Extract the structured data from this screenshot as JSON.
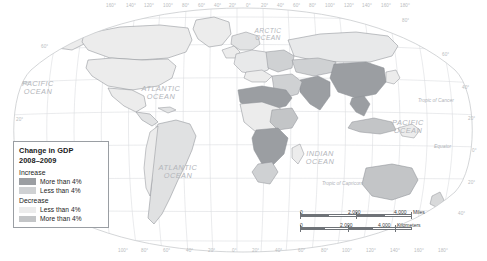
{
  "map": {
    "projection_note": "world map, Robinson-style graticule",
    "background_color": "#ffffff",
    "land_default_color": "#f0f0f0",
    "border_color": "#8e9196",
    "graticule_color": "#d9dbde",
    "ocean_color": "#ffffff"
  },
  "legend": {
    "title_line1": "Change in GDP",
    "title_line2": "2008–2009",
    "groups": [
      {
        "name": "increase",
        "heading": "Increase",
        "items": [
          {
            "label": "More than 4%",
            "color": "#9b9ea2"
          },
          {
            "label": "Less than 4%",
            "color": "#cfd1d3"
          }
        ]
      },
      {
        "name": "decrease",
        "heading": "Decrease",
        "items": [
          {
            "label": "Less than 4%",
            "color": "#ececec"
          },
          {
            "label": "More than 4%",
            "color": "#c3c5c7"
          }
        ]
      }
    ]
  },
  "scale": {
    "miles": {
      "zero": "0",
      "mid": "2,000",
      "max": "4,000",
      "unit": "Miles"
    },
    "kilometers": {
      "zero": "0",
      "mid": "2,000",
      "max": "4,000",
      "unit": "Kilometers"
    }
  },
  "labels": {
    "oceans": [
      {
        "name": "arctic-ocean",
        "line1": "ARCTIC",
        "line2": "OCEAN",
        "x": 268,
        "y": 27,
        "size": "mid"
      },
      {
        "name": "pacific-ocean-north",
        "line1": "PACIFIC",
        "line2": "OCEAN",
        "x": 38,
        "y": 80,
        "size": "big"
      },
      {
        "name": "atlantic-ocean-north",
        "line1": "ATLANTIC",
        "line2": "OCEAN",
        "x": 161,
        "y": 85,
        "size": "big"
      },
      {
        "name": "atlantic-ocean-south",
        "line1": "ATLANTIC",
        "line2": "OCEAN",
        "x": 178,
        "y": 164,
        "size": "big"
      },
      {
        "name": "indian-ocean",
        "line1": "INDIAN",
        "line2": "OCEAN",
        "x": 320,
        "y": 150,
        "size": "big"
      },
      {
        "name": "pacific-ocean-east",
        "line1": "PACIFIC",
        "line2": "OCEAN",
        "x": 408,
        "y": 119,
        "size": "big"
      }
    ],
    "tropics": [
      {
        "name": "tropic-of-cancer",
        "text": "Tropic of Cancer",
        "x": 418,
        "y": 98
      },
      {
        "name": "equator",
        "text": "Equator",
        "x": 434,
        "y": 144
      },
      {
        "name": "tropic-of-capricorn",
        "text": "Tropic of Capricorn",
        "x": 322,
        "y": 181
      }
    ],
    "longitude_top": [
      {
        "text": "160°",
        "x": 106
      },
      {
        "text": "140°",
        "x": 126
      },
      {
        "text": "120°",
        "x": 144
      },
      {
        "text": "100°",
        "x": 163
      },
      {
        "text": "80°",
        "x": 182
      },
      {
        "text": "60°",
        "x": 198
      },
      {
        "text": "40°",
        "x": 214
      },
      {
        "text": "20°",
        "x": 229
      },
      {
        "text": "0°",
        "x": 246
      },
      {
        "text": "20°",
        "x": 261
      },
      {
        "text": "40°",
        "x": 277
      },
      {
        "text": "60°",
        "x": 293
      },
      {
        "text": "80°",
        "x": 309
      },
      {
        "text": "100°",
        "x": 325
      },
      {
        "text": "120°",
        "x": 344
      },
      {
        "text": "140°",
        "x": 362
      },
      {
        "text": "160°",
        "x": 381
      },
      {
        "text": "180°",
        "x": 400
      }
    ],
    "longitude_bottom": [
      {
        "text": "100°",
        "x": 118
      },
      {
        "text": "80°",
        "x": 141
      },
      {
        "text": "60°",
        "x": 163
      },
      {
        "text": "40°",
        "x": 186
      },
      {
        "text": "20°",
        "x": 208
      },
      {
        "text": "0°",
        "x": 232
      },
      {
        "text": "20°",
        "x": 252
      },
      {
        "text": "40°",
        "x": 275
      },
      {
        "text": "60°",
        "x": 298
      },
      {
        "text": "80°",
        "x": 321
      },
      {
        "text": "100°",
        "x": 342
      },
      {
        "text": "120°",
        "x": 366
      },
      {
        "text": "140°",
        "x": 390
      },
      {
        "text": "160°",
        "x": 414
      },
      {
        "text": "180°",
        "x": 438
      }
    ],
    "latitude_left": [
      {
        "text": "60°",
        "x": 41,
        "y": 44
      },
      {
        "text": "40°",
        "x": 22,
        "y": 81
      },
      {
        "text": "20°",
        "x": 16,
        "y": 117
      }
    ],
    "latitude_right": [
      {
        "text": "80°",
        "x": 402,
        "y": 18
      },
      {
        "text": "60°",
        "x": 442,
        "y": 52
      },
      {
        "text": "40°",
        "x": 462,
        "y": 85
      },
      {
        "text": "20°",
        "x": 468,
        "y": 116
      },
      {
        "text": "0°",
        "x": 472,
        "y": 148
      },
      {
        "text": "20°",
        "x": 468,
        "y": 180
      },
      {
        "text": "40°",
        "x": 458,
        "y": 211
      }
    ]
  }
}
